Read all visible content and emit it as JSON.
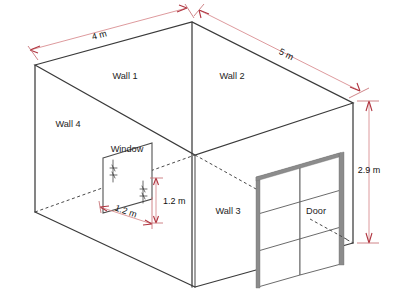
{
  "diagram": {
    "background_color": "#ffffff",
    "line_color": "#3a3a3a",
    "dimension_color": "#b03540",
    "dimension_line_color": "#d98f92",
    "door_frame_color": "#8c8c8c"
  },
  "walls": [
    {
      "id": "wall-1",
      "label": "Wall 1",
      "x": 125,
      "y": 79
    },
    {
      "id": "wall-2",
      "label": "Wall 2",
      "x": 232,
      "y": 79
    },
    {
      "id": "wall-3",
      "label": "Wall 3",
      "x": 228,
      "y": 214
    },
    {
      "id": "wall-4",
      "label": "Wall 4",
      "x": 68,
      "y": 127
    }
  ],
  "features": [
    {
      "id": "window",
      "label": "Window",
      "x": 127,
      "y": 152
    },
    {
      "id": "door",
      "label": "Door",
      "x": 316,
      "y": 214
    }
  ],
  "dimensions": [
    {
      "id": "width-top-left",
      "label": "4 m",
      "value": 4,
      "unit": "m",
      "measures": "Wall 1 width (top-left roof edge)",
      "x": 100,
      "y": 38,
      "rotation": -15
    },
    {
      "id": "length-top-right",
      "label": "5 m",
      "value": 5,
      "unit": "m",
      "measures": "Wall 2 length (top-right roof edge)",
      "x": 285,
      "y": 57,
      "rotation": 27
    },
    {
      "id": "height-right",
      "label": "2.9 m",
      "value": 2.9,
      "unit": "m",
      "measures": "Room height (right vertical edge)",
      "x": 369,
      "y": 173,
      "rotation": 0
    },
    {
      "id": "window-height",
      "label": "1.2 m",
      "value": 1.2,
      "unit": "m",
      "measures": "Window height",
      "x": 163,
      "y": 204,
      "rotation": 0
    },
    {
      "id": "window-width",
      "label": "1.2 m",
      "value": 1.2,
      "unit": "m",
      "measures": "Window width",
      "x": 125,
      "y": 214,
      "rotation": 19
    }
  ]
}
